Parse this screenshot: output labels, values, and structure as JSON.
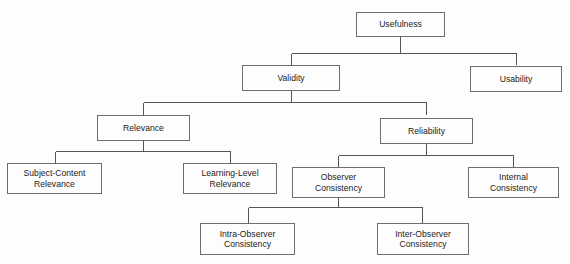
{
  "diagram": {
    "title": "Usefulness",
    "type": "hierarchy-tree",
    "background_color": "#fdfdfd",
    "box_border_color": "#6e6e6e",
    "line_color": "#555555",
    "text_color": "#1b1b1b",
    "nodes": [
      {
        "id": "usefulness",
        "label": "Usefulness",
        "level": 0,
        "x": 356,
        "y": 12,
        "w": 89,
        "h": 25,
        "parent": null
      },
      {
        "id": "validity",
        "label": "Validity",
        "level": 1,
        "x": 242,
        "y": 65,
        "w": 98,
        "h": 26,
        "parent": "usefulness"
      },
      {
        "id": "usability",
        "label": "Usability",
        "level": 1,
        "x": 470,
        "y": 66,
        "w": 92,
        "h": 26,
        "parent": "usefulness"
      },
      {
        "id": "relevance",
        "label": "Relevance",
        "level": 2,
        "x": 97,
        "y": 115,
        "w": 93,
        "h": 26,
        "parent": "validity"
      },
      {
        "id": "reliability",
        "label": "Reliability",
        "level": 2,
        "x": 380,
        "y": 118,
        "w": 93,
        "h": 26,
        "parent": "validity"
      },
      {
        "id": "subject-content-relevance",
        "label": "Subject-Content\nRelevance",
        "level": 3,
        "x": 7,
        "y": 163,
        "w": 95,
        "h": 31,
        "parent": "relevance"
      },
      {
        "id": "learning-level-relevance",
        "label": "Learning-Level\nRelevance",
        "level": 3,
        "x": 183,
        "y": 163,
        "w": 94,
        "h": 31,
        "parent": "relevance"
      },
      {
        "id": "observer-consistency",
        "label": "Observer\nConsistency",
        "level": 3,
        "x": 292,
        "y": 167,
        "w": 93,
        "h": 31,
        "parent": "reliability"
      },
      {
        "id": "internal-consistency",
        "label": "Internal\nConsistency",
        "level": 3,
        "x": 468,
        "y": 167,
        "w": 91,
        "h": 31,
        "parent": "reliability"
      },
      {
        "id": "intra-observer-consistency",
        "label": "Intra-Observer\nConsistency",
        "level": 4,
        "x": 200,
        "y": 223,
        "w": 95,
        "h": 32,
        "parent": "observer-consistency"
      },
      {
        "id": "inter-observer-consistency",
        "label": "Inter-Observer\nConsistency",
        "level": 4,
        "x": 377,
        "y": 223,
        "w": 92,
        "h": 32,
        "parent": "observer-consistency"
      }
    ],
    "connectors": [
      {
        "id": "usefulness-children",
        "from": "usefulness",
        "to": [
          "validity",
          "usability"
        ],
        "bus_y": 53,
        "parent_stub_x": 400,
        "parent_stub_y0": 37,
        "child_xs": [
          291,
          516
        ],
        "child_y": 65
      },
      {
        "id": "validity-children",
        "from": "validity",
        "to": [
          "relevance",
          "reliability"
        ],
        "bus_y": 102,
        "parent_stub_x": 291,
        "parent_stub_y0": 91,
        "child_xs": [
          143,
          426
        ],
        "child_y": 115
      },
      {
        "id": "relevance-children",
        "from": "relevance",
        "to": [
          "subject-content-relevance",
          "learning-level-relevance"
        ],
        "bus_y": 151,
        "parent_stub_x": 143,
        "parent_stub_y0": 141,
        "child_xs": [
          55,
          230
        ],
        "child_y": 163
      },
      {
        "id": "reliability-children",
        "from": "reliability",
        "to": [
          "observer-consistency",
          "internal-consistency"
        ],
        "bus_y": 155,
        "parent_stub_x": 426,
        "parent_stub_y0": 144,
        "child_xs": [
          338,
          513
        ],
        "child_y": 167
      },
      {
        "id": "observer-consistency-children",
        "from": "observer-consistency",
        "to": [
          "intra-observer-consistency",
          "inter-observer-consistency"
        ],
        "bus_y": 207,
        "parent_stub_x": 338,
        "parent_stub_y0": 198,
        "child_xs": [
          248,
          422
        ],
        "child_y": 223
      }
    ]
  }
}
